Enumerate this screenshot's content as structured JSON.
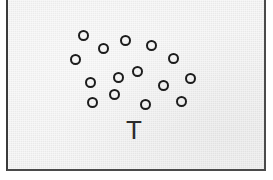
{
  "figure": {
    "caption_letter": "T",
    "panel_label": "scatter-panel",
    "background_color": "#e9e9e9",
    "border_color": "#3a3a3a",
    "marker_color": "#1c1c1c",
    "letter_color": "#2a2a2a",
    "marker_count": 15
  },
  "chart_data": {
    "type": "scatter",
    "title": "T",
    "xlabel": "",
    "ylabel": "",
    "xlim": [
      0,
      273
    ],
    "ylim": [
      0,
      180
    ],
    "grid": false,
    "legend": null,
    "marker_style": "open-circle",
    "marker_diameter_px": 11,
    "series": [
      {
        "name": "points",
        "points": [
          {
            "x": 81,
            "y": 35
          },
          {
            "x": 101,
            "y": 48
          },
          {
            "x": 123,
            "y": 40
          },
          {
            "x": 149,
            "y": 45
          },
          {
            "x": 73,
            "y": 59
          },
          {
            "x": 171,
            "y": 58
          },
          {
            "x": 135,
            "y": 71
          },
          {
            "x": 116,
            "y": 77
          },
          {
            "x": 88,
            "y": 82
          },
          {
            "x": 188,
            "y": 78
          },
          {
            "x": 112,
            "y": 94
          },
          {
            "x": 161,
            "y": 85
          },
          {
            "x": 90,
            "y": 102
          },
          {
            "x": 143,
            "y": 104
          },
          {
            "x": 179,
            "y": 101
          }
        ]
      }
    ],
    "annotations": [
      {
        "text": "T",
        "x": 132,
        "y": 130
      }
    ]
  }
}
